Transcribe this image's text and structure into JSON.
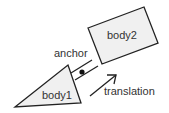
{
  "diagram": {
    "labels": {
      "body1": "body1",
      "body2": "body2",
      "anchor": "anchor",
      "translation": "translation"
    },
    "colors": {
      "stroke": "#222222",
      "fill": "#f0f0f0",
      "text": "#333333"
    }
  }
}
